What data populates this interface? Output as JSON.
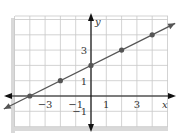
{
  "chart_data": {
    "type": "line",
    "title": "",
    "xlabel": "x",
    "ylabel": "y",
    "xlim": [
      -5,
      5
    ],
    "ylim": [
      -2,
      5.2
    ],
    "grid": true,
    "x_tick_labels": [
      "-3",
      "-1",
      "1",
      "3"
    ],
    "y_tick_labels": [
      "-1",
      "1",
      "3"
    ],
    "x_ticks": [
      -3,
      -1,
      1,
      3
    ],
    "y_ticks": [
      -1,
      1,
      3
    ],
    "series": [
      {
        "name": "line",
        "equation": "y = x/2 + 2",
        "x": [
          -4,
          -2,
          0,
          2,
          4
        ],
        "y": [
          0,
          1,
          2,
          3,
          4
        ],
        "markers": true,
        "arrows_both_ends": true
      }
    ]
  },
  "colors": {
    "grid": "#c8c8c8",
    "axis": "#111111",
    "line": "#555555",
    "marker": "#555555",
    "panel_shadow": "#d9d9d9"
  }
}
